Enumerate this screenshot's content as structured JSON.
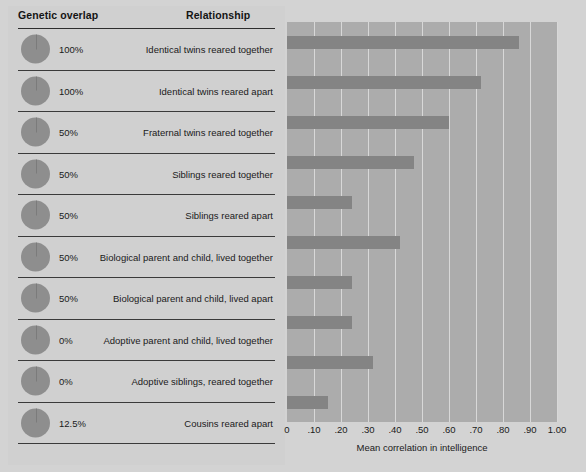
{
  "table": {
    "header_genetic": "Genetic overlap",
    "header_relationship": "Relationship",
    "rows": [
      {
        "genetic_overlap": "100%",
        "relationship": "Identical twins reared together"
      },
      {
        "genetic_overlap": "100%",
        "relationship": "Identical twins reared apart"
      },
      {
        "genetic_overlap": "50%",
        "relationship": "Fraternal twins reared together"
      },
      {
        "genetic_overlap": "50%",
        "relationship": "Siblings reared together"
      },
      {
        "genetic_overlap": "50%",
        "relationship": "Siblings reared apart"
      },
      {
        "genetic_overlap": "50%",
        "relationship": "Biological parent and child, lived together"
      },
      {
        "genetic_overlap": "50%",
        "relationship": "Biological parent and child, lived apart"
      },
      {
        "genetic_overlap": "0%",
        "relationship": "Adoptive parent and child, lived together"
      },
      {
        "genetic_overlap": "0%",
        "relationship": "Adoptive siblings, reared together"
      },
      {
        "genetic_overlap": "12.5%",
        "relationship": "Cousins reared apart"
      }
    ]
  },
  "colors": {
    "figure_background": "#d3d3d3",
    "table_background": "#d0d0d0",
    "plot_background": "#acacac",
    "bar_fill": "#848484",
    "gridline": "#d8d8d8",
    "pie_fill": "#8e8e8e",
    "text": "#1a1a1a",
    "rule": "#3a3a3a"
  },
  "chart_data": {
    "type": "bar",
    "orientation": "horizontal",
    "title": "",
    "xlabel": "Mean correlation in intelligence",
    "ylabel": "",
    "xlim": [
      0,
      1.0
    ],
    "grid": true,
    "legend": null,
    "tick_labels": [
      "0",
      ".10",
      ".20",
      ".30",
      ".40",
      ".50",
      ".60",
      ".70",
      ".80",
      ".90",
      "1.00"
    ],
    "tick_values": [
      0,
      0.1,
      0.2,
      0.3,
      0.4,
      0.5,
      0.6,
      0.7,
      0.8,
      0.9,
      1.0
    ],
    "categories": [
      "Identical twins reared together",
      "Identical twins reared apart",
      "Fraternal twins reared together",
      "Siblings reared together",
      "Siblings reared apart",
      "Biological parent and child, lived together",
      "Biological parent and child, lived apart",
      "Adoptive parent and child, lived together",
      "Adoptive siblings, reared together",
      "Cousins reared apart"
    ],
    "values": [
      0.86,
      0.72,
      0.6,
      0.47,
      0.24,
      0.42,
      0.24,
      0.24,
      0.32,
      0.15
    ],
    "genetic_overlap": [
      "100%",
      "100%",
      "50%",
      "50%",
      "50%",
      "50%",
      "50%",
      "0%",
      "0%",
      "12.5%"
    ]
  }
}
